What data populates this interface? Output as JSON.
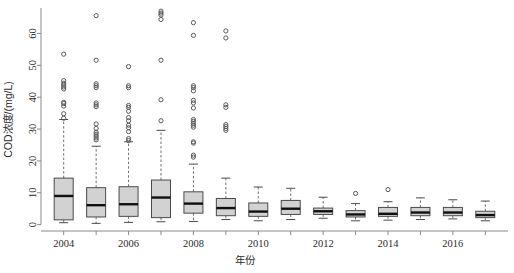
{
  "chart_data": {
    "type": "box",
    "title": "",
    "xlabel": "年份",
    "ylabel": "COD浓度/(mg/L)",
    "xlim": [
      2003.3,
      2017.7
    ],
    "ylim": [
      -2,
      68
    ],
    "y_ticks": [
      0,
      10,
      20,
      30,
      40,
      50,
      60
    ],
    "x_ticks": [
      2004,
      2006,
      2008,
      2010,
      2012,
      2014,
      2016
    ],
    "x_minor_ticks": [
      2005,
      2007,
      2009,
      2011,
      2013,
      2015,
      2017
    ],
    "grid": false,
    "legend": null,
    "box_fill": "#d2d2d2",
    "box_edge": "#4a4a4a",
    "median_color": "#101010",
    "outlier_color": "#5a5a5a",
    "categories": [
      2004,
      2005,
      2006,
      2007,
      2008,
      2009,
      2010,
      2011,
      2012,
      2013,
      2014,
      2015,
      2016,
      2017
    ],
    "boxes": [
      {
        "x": 2004,
        "whisker_low": 0.6,
        "q1": 1.5,
        "median": 9.0,
        "q3": 14.6,
        "whisker_high": 33.0,
        "outliers": [
          33.4,
          34.8,
          37.2,
          38.0,
          38.4,
          42.6,
          43.2,
          43.8,
          44.4,
          45.2,
          53.5
        ]
      },
      {
        "x": 2005,
        "whisker_low": 0.4,
        "q1": 2.4,
        "median": 6.1,
        "q3": 11.6,
        "whisker_high": 24.6,
        "outliers": [
          26.6,
          27.2,
          27.8,
          28.4,
          29.0,
          30.2,
          31.6,
          37.0,
          37.6,
          38.2,
          43.0,
          43.6,
          44.2,
          51.6,
          65.6
        ]
      },
      {
        "x": 2006,
        "whisker_low": 0.7,
        "q1": 2.6,
        "median": 6.4,
        "q3": 11.9,
        "whisker_high": 26.0,
        "outliers": [
          26.4,
          27.0,
          29.2,
          30.4,
          31.2,
          32.6,
          33.6,
          35.6,
          36.8,
          37.4,
          43.0,
          43.6,
          49.6
        ]
      },
      {
        "x": 2007,
        "whisker_low": 0.9,
        "q1": 2.2,
        "median": 8.5,
        "q3": 14.0,
        "whisker_high": 29.6,
        "outliers": [
          32.6,
          39.2,
          51.6,
          64.4,
          65.8,
          66.4,
          67.0
        ]
      },
      {
        "x": 2008,
        "whisker_low": 1.0,
        "q1": 3.6,
        "median": 6.6,
        "q3": 10.3,
        "whisker_high": 19.0,
        "outliers": [
          21.2,
          21.8,
          25.6,
          26.0,
          30.6,
          31.2,
          31.8,
          32.4,
          33.0,
          36.6,
          38.2,
          39.0,
          42.0,
          43.0,
          43.6,
          59.4,
          63.4
        ]
      },
      {
        "x": 2009,
        "whisker_low": 1.6,
        "q1": 2.8,
        "median": 5.2,
        "q3": 8.2,
        "whisker_high": 14.6,
        "outliers": [
          29.6,
          30.2,
          30.8,
          31.4,
          36.8,
          37.6,
          58.6,
          60.8
        ]
      },
      {
        "x": 2010,
        "whisker_low": 1.2,
        "q1": 2.6,
        "median": 4.1,
        "q3": 6.8,
        "whisker_high": 11.8,
        "outliers": []
      },
      {
        "x": 2011,
        "whisker_low": 1.6,
        "q1": 3.2,
        "median": 5.0,
        "q3": 7.6,
        "whisker_high": 11.4,
        "outliers": []
      },
      {
        "x": 2012,
        "whisker_low": 2.0,
        "q1": 3.2,
        "median": 4.2,
        "q3": 5.2,
        "whisker_high": 8.6,
        "outliers": []
      },
      {
        "x": 2013,
        "whisker_low": 1.2,
        "q1": 2.4,
        "median": 3.2,
        "q3": 4.4,
        "whisker_high": 6.6,
        "outliers": [
          9.8
        ]
      },
      {
        "x": 2014,
        "whisker_low": 1.4,
        "q1": 2.6,
        "median": 3.4,
        "q3": 5.4,
        "whisker_high": 7.2,
        "outliers": [
          11.0
        ]
      },
      {
        "x": 2015,
        "whisker_low": 1.6,
        "q1": 2.8,
        "median": 3.8,
        "q3": 5.4,
        "whisker_high": 8.4,
        "outliers": []
      },
      {
        "x": 2016,
        "whisker_low": 1.8,
        "q1": 2.8,
        "median": 3.8,
        "q3": 5.4,
        "whisker_high": 7.8,
        "outliers": []
      },
      {
        "x": 2017,
        "whisker_low": 1.2,
        "q1": 2.2,
        "median": 3.0,
        "q3": 4.2,
        "whisker_high": 7.4,
        "outliers": []
      }
    ]
  }
}
